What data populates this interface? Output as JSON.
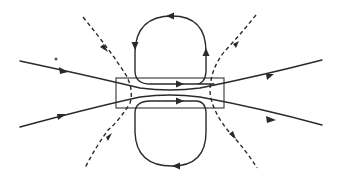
{
  "diagram": {
    "type": "field-line-diagram",
    "colors": {
      "line": "#2a2a2a",
      "background": "#ffffff"
    },
    "elements": {
      "central_box": {
        "x": 116,
        "y": 78,
        "width": 108,
        "height": 30
      },
      "upper_loop": {
        "direction": "counterclockwise",
        "arrows": 4
      },
      "lower_loop": {
        "direction": "clockwise",
        "arrows": 3
      },
      "through_lines": [
        {
          "name": "upper-through-line",
          "direction": "left-to-right"
        },
        {
          "name": "lower-through-line",
          "direction": "left-to-right"
        }
      ],
      "dashed_lines": [
        {
          "name": "left-dashed-boundary",
          "arrow_direction": "toward-box"
        },
        {
          "name": "right-dashed-boundary",
          "arrow_direction": "away-from-box"
        }
      ],
      "marker_dot": {
        "x": 56,
        "y": 59
      }
    },
    "labels": []
  }
}
